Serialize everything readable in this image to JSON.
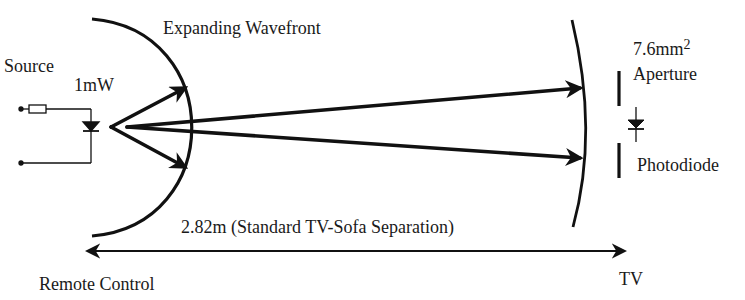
{
  "diagram": {
    "labels": {
      "source": "Source",
      "power": "1mW",
      "wavefront": "Expanding Wavefront",
      "aperture_area": "7.6mm",
      "aperture_area_exponent": "2",
      "aperture": "Aperture",
      "photodiode": "Photodiode",
      "distance": "2.82m (Standard TV-Sofa Separation)",
      "remote_control": "Remote Control",
      "tv": "TV"
    },
    "colors": {
      "ink": "#111111",
      "text": "#1a1a1a",
      "background": "#ffffff"
    }
  }
}
